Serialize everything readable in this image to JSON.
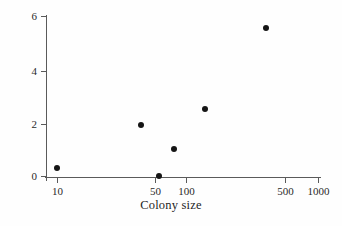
{
  "chart_data": {
    "type": "scatter",
    "title": "",
    "xlabel": "Colony size",
    "ylabel": "Swallow bugs per nestling",
    "xscale": "log",
    "yscale": "linear",
    "xlim": [
      8,
      1100
    ],
    "ylim": [
      -0.35,
      6.2
    ],
    "grid": false,
    "legend": null,
    "xticks": [
      {
        "value": 10,
        "label": "10",
        "px": 57
      },
      {
        "value": 50,
        "label": "50",
        "px": 155
      },
      {
        "value": 100,
        "label": "100",
        "px": 186
      },
      {
        "value": 500,
        "label": "500",
        "px": 285
      },
      {
        "value": 1000,
        "label": "1000",
        "px": 318
      }
    ],
    "yticks": [
      {
        "value": 0,
        "label": "0",
        "px": 176
      },
      {
        "value": 2,
        "label": "2",
        "px": 124
      },
      {
        "value": 4,
        "label": "4",
        "px": 71
      },
      {
        "value": 6,
        "label": "6",
        "px": 16
      }
    ],
    "points": [
      {
        "x": 10,
        "y": 0.32,
        "px": 57,
        "py": 168
      },
      {
        "x": 45,
        "y": 1.92,
        "px": 141,
        "py": 125
      },
      {
        "x": 60,
        "y": 0.02,
        "px": 159,
        "py": 176
      },
      {
        "x": 83,
        "y": 1.05,
        "px": 174,
        "py": 149
      },
      {
        "x": 135,
        "y": 2.55,
        "px": 205,
        "py": 109
      },
      {
        "x": 390,
        "y": 5.6,
        "px": 266,
        "py": 28
      }
    ],
    "marker": {
      "shape": "circle",
      "color": "#151515",
      "size_px": 6
    },
    "axis_color": "#5a5a5a",
    "background": "#fefefe"
  }
}
